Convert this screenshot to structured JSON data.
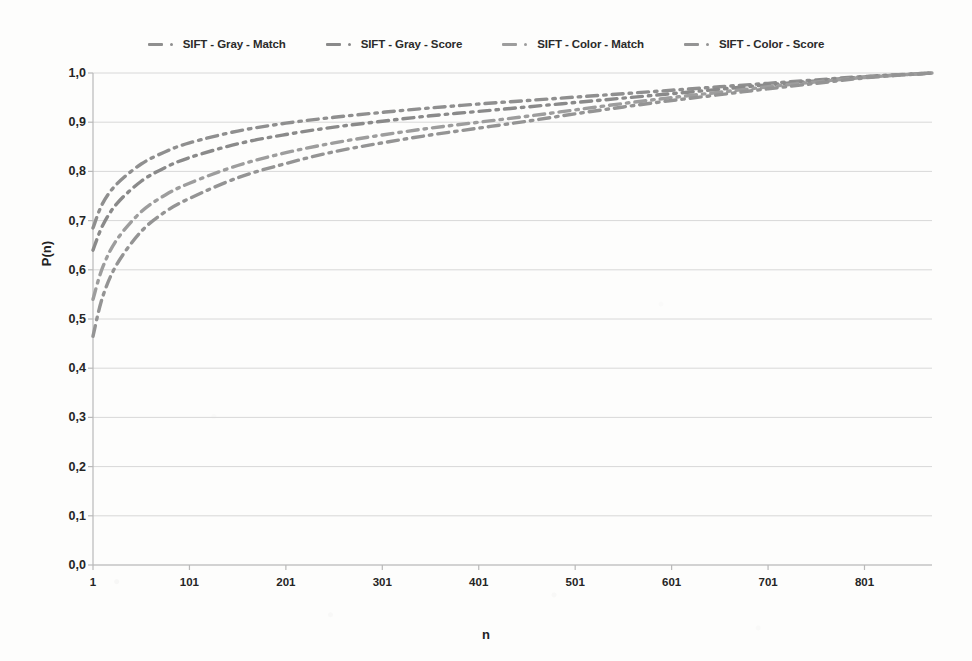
{
  "chart_data": {
    "type": "line",
    "title": "",
    "subtitle": "",
    "xlabel": "n",
    "ylabel": "P(n)",
    "xlim": [
      1,
      871
    ],
    "ylim": [
      0.0,
      1.0
    ],
    "grid": true,
    "legend_position": "top-center",
    "decimal_separator": ",",
    "x_tick_labels": [
      "1",
      "101",
      "201",
      "301",
      "401",
      "501",
      "601",
      "701",
      "801"
    ],
    "x_tick_values": [
      1,
      101,
      201,
      301,
      401,
      501,
      601,
      701,
      801
    ],
    "y_tick_labels": [
      "0,0",
      "0,1",
      "0,2",
      "0,3",
      "0,4",
      "0,5",
      "0,6",
      "0,7",
      "0,8",
      "0,9",
      "1,0"
    ],
    "y_tick_values": [
      0.0,
      0.1,
      0.2,
      0.3,
      0.4,
      0.5,
      0.6,
      0.7,
      0.8,
      0.9,
      1.0
    ],
    "line_style": "dash-dot",
    "x": [
      1,
      11,
      26,
      51,
      76,
      101,
      151,
      201,
      251,
      301,
      351,
      401,
      451,
      501,
      551,
      601,
      651,
      701,
      751,
      801,
      871
    ],
    "series": [
      {
        "name": "SIFT - Gray - Match",
        "color": "#8f8f8f",
        "values": [
          0.685,
          0.735,
          0.775,
          0.815,
          0.84,
          0.858,
          0.882,
          0.898,
          0.91,
          0.92,
          0.929,
          0.937,
          0.944,
          0.951,
          0.958,
          0.965,
          0.972,
          0.979,
          0.986,
          0.993,
          1.0
        ]
      },
      {
        "name": "SIFT - Gray - Score",
        "color": "#8a8a8a",
        "values": [
          0.64,
          0.69,
          0.735,
          0.78,
          0.808,
          0.828,
          0.856,
          0.875,
          0.89,
          0.902,
          0.913,
          0.922,
          0.931,
          0.94,
          0.949,
          0.958,
          0.967,
          0.976,
          0.984,
          0.992,
          1.0
        ]
      },
      {
        "name": "SIFT - Color - Match",
        "color": "#9d9d9d",
        "values": [
          0.54,
          0.605,
          0.662,
          0.718,
          0.752,
          0.776,
          0.812,
          0.838,
          0.858,
          0.874,
          0.888,
          0.9,
          0.912,
          0.925,
          0.938,
          0.95,
          0.961,
          0.972,
          0.982,
          0.991,
          1.0
        ]
      },
      {
        "name": "SIFT - Color - Score",
        "color": "#949494",
        "values": [
          0.465,
          0.545,
          0.612,
          0.678,
          0.718,
          0.745,
          0.787,
          0.816,
          0.84,
          0.858,
          0.874,
          0.888,
          0.902,
          0.917,
          0.931,
          0.944,
          0.956,
          0.968,
          0.979,
          0.99,
          1.0
        ]
      }
    ]
  },
  "legend": {
    "entries": [
      {
        "label": "SIFT - Gray - Match"
      },
      {
        "label": "SIFT - Gray - Score"
      },
      {
        "label": "SIFT - Color - Match"
      },
      {
        "label": "SIFT - Color - Score"
      }
    ]
  },
  "axes": {
    "y_title": "P(n)",
    "x_title": "n"
  },
  "colors": {
    "gridline": "#d8d8d8",
    "axis": "#b9b9b9",
    "text": "#252525",
    "series_1": "#8f8f8f",
    "series_2": "#8a8a8a",
    "series_3": "#9d9d9d",
    "series_4": "#949494"
  }
}
